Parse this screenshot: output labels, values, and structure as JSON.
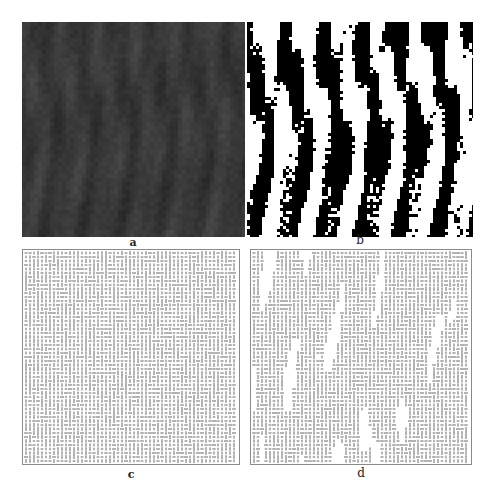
{
  "figure": {
    "panels": [
      {
        "id": "a",
        "label": "a",
        "kind": "grayscale-texture",
        "base_color": "#3b3b3b",
        "highlight_color": "#5a5a5a"
      },
      {
        "id": "b",
        "label": "b",
        "kind": "binary-segmentation",
        "fg_color": "#000000",
        "bg_color": "#ffffff"
      },
      {
        "id": "c",
        "label": "c",
        "kind": "vector-field-grid",
        "mark_color": "#555555",
        "spacing_px": 4
      },
      {
        "id": "d",
        "label": "d",
        "kind": "vector-field-grid-masked",
        "mark_color": "#555555",
        "spacing_px": 4
      }
    ]
  },
  "labels": {
    "a": "a",
    "b": "b",
    "c": "c",
    "d": "d"
  }
}
